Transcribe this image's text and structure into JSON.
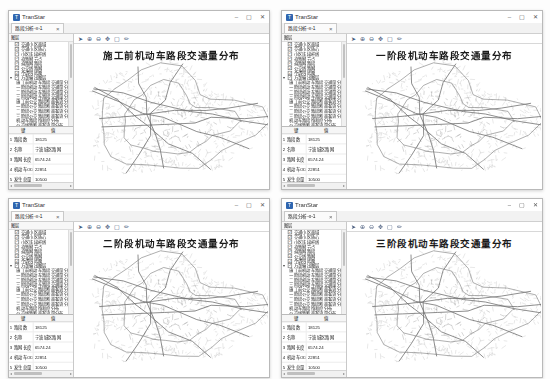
{
  "app": {
    "name": "TranStar",
    "icon_letter": "T",
    "accent_color": "#2f66b0",
    "window_controls": [
      {
        "name": "minimize-button",
        "glyph": "–"
      },
      {
        "name": "maximize-button",
        "glyph": "▢"
      },
      {
        "name": "close-button",
        "glyph": "✕"
      }
    ]
  },
  "tab": {
    "label": "路段分析-x-1",
    "close_glyph": "×"
  },
  "map_toolbar": [
    {
      "name": "pointer-icon",
      "glyph": "➤"
    },
    {
      "name": "zoom-in-icon",
      "glyph": "⊕"
    },
    {
      "name": "zoom-out-icon",
      "glyph": "⊖"
    },
    {
      "name": "pan-icon",
      "glyph": "✥"
    },
    {
      "name": "full-extent-icon",
      "glyph": "▢"
    },
    {
      "name": "measure-icon",
      "glyph": "✏"
    }
  ],
  "layers_panel": {
    "header": "图层",
    "root_items": [
      {
        "label": "交通小区面域",
        "checked": true,
        "expanded": false
      },
      {
        "label": "交通小区质心",
        "checked": true,
        "expanded": false
      },
      {
        "label": "小区连接杆线",
        "checked": true,
        "expanded": false
      },
      {
        "label": "道路网节点",
        "checked": true,
        "expanded": false
      },
      {
        "label": "道路网路段",
        "checked": true,
        "expanded": false
      },
      {
        "label": "公交线路网",
        "checked": true,
        "expanded": false
      },
      {
        "label": "不透明底图",
        "checked": true,
        "expanded": false
      },
      {
        "label": "方案输出图层",
        "checked": true,
        "expanded": true
      }
    ],
    "sub_items": [
      "施工前机动车路段交通量分布",
      "一阶段机动车路段交通量分布",
      "二阶段机动车路段交通量分布",
      "三阶段机动车路段交通量分布",
      "施工前公交路段断面客流分布",
      "一阶段公交路段断面客流分布",
      "二阶段公交路段断面客流分布",
      "三阶段公交路段断面客流分布",
      "机动车路段饱和度分布",
      "公交线路断面客流量分布"
    ]
  },
  "attribute_table": {
    "columns": [
      "键",
      "值"
    ],
    "rows": [
      {
        "no": "1",
        "key": "路段数",
        "value": "18125"
      },
      {
        "no": "2",
        "key": "名称",
        "value": "宁波城区路网"
      },
      {
        "no": "3",
        "key": "路网长度",
        "value": "6574.24"
      },
      {
        "no": "4",
        "key": "机动车OD",
        "value": "22851"
      },
      {
        "no": "5",
        "key": "发生总量",
        "value": "10500"
      },
      {
        "no": "6",
        "key": "机动车交通量",
        "value": "1395.43"
      }
    ]
  },
  "windows": [
    {
      "map_title": "施工前机动车路段交通量分布"
    },
    {
      "map_title": "一阶段机动车路段交通量分布"
    },
    {
      "map_title": "二阶段机动车路段交通量分布"
    },
    {
      "map_title": "三阶段机动车路段交通量分布"
    }
  ],
  "map": {
    "stroke_minor": "#b4b4b4",
    "stroke_dense": "#8d8d8d",
    "stroke_arterial": "#6a6a6a",
    "stroke_ring": "#707070"
  }
}
